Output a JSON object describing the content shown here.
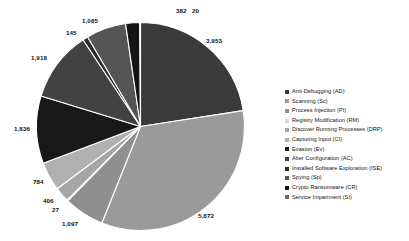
{
  "chart_data": {
    "type": "pie",
    "title": "",
    "xlabel": "",
    "ylabel": "",
    "legend_position": "right",
    "grid": false,
    "total": 17545,
    "categories": [
      "Anti-Debugging (AD)",
      "Scanning (Sc)",
      "Process Injection (PI)",
      "Registry Modification (RM)",
      "Discover Running Processes (DRP)",
      "Capturing Input (CI)",
      "Evasion (Ev)",
      "Alter Configuration (AC)",
      "Installed Software Exploration (ISE)",
      "Spying (Sp)",
      "Crypto Ransomware (CR)",
      "Service Impairment (SI)"
    ],
    "values": [
      3953,
      5872,
      1097,
      27,
      406,
      784,
      1836,
      1918,
      145,
      1085,
      382,
      20
    ],
    "colors": [
      "#3a3a3a",
      "#9a9a9a",
      "#8f8f8f",
      "#ffffff",
      "#a5a5a5",
      "#b0b0b0",
      "#181818",
      "#424242",
      "#2c2c2c",
      "#555555",
      "#141414",
      "#6b6b6b"
    ],
    "slices": [
      {
        "label": "Anti-Debugging (AD)",
        "value": 3953,
        "display": "3,953",
        "color": "#3a3a3a"
      },
      {
        "label": "Scanning (Sc)",
        "value": 5872,
        "display": "5,872",
        "color": "#9a9a9a"
      },
      {
        "label": "Process Injection (PI)",
        "value": 1097,
        "display": "1,097",
        "color": "#8f8f8f"
      },
      {
        "label": "Registry Modification (RM)",
        "value": 27,
        "display": "27",
        "color": "#ffffff"
      },
      {
        "label": "Discover Running Processes (DRP)",
        "value": 406,
        "display": "406",
        "color": "#a5a5a5"
      },
      {
        "label": "Capturing Input (CI)",
        "value": 784,
        "display": "784",
        "color": "#b0b0b0"
      },
      {
        "label": "Evasion (Ev)",
        "value": 1836,
        "display": "1,836",
        "color": "#181818"
      },
      {
        "label": "Alter Configuration (AC)",
        "value": 1918,
        "display": "1,918",
        "color": "#424242"
      },
      {
        "label": "Installed Software Exploration (ISE)",
        "value": 145,
        "display": "145",
        "color": "#2c2c2c"
      },
      {
        "label": "Spying (Sp)",
        "value": 1085,
        "display": "1,085",
        "color": "#555555"
      },
      {
        "label": "Crypto Ransomware (CR)",
        "value": 382,
        "display": "382",
        "color": "#141414"
      },
      {
        "label": "Service Impairment (SI)",
        "value": 20,
        "display": "20",
        "color": "#6b6b6b"
      }
    ]
  },
  "labels": {
    "v_3953": "3,953",
    "v_5872": "5,872",
    "v_1097": "1,097",
    "v_27": "27",
    "v_406": "406",
    "v_784": "784",
    "v_1836": "1,836",
    "v_1918": "1,918",
    "v_145": "145",
    "v_1085": "1,085",
    "v_382": "382",
    "v_20": "20"
  },
  "legend": {
    "items": [
      {
        "label": "Anti-Debugging (AD)",
        "color": "#3a3a3a"
      },
      {
        "label": "Scanning (Sc)",
        "color": "#9a9a9a"
      },
      {
        "label": "Process Injection (PI)",
        "color": "#8f8f8f"
      },
      {
        "label": "Registry Modification (RM)",
        "color": "#d8d8d8"
      },
      {
        "label": "Discover Running Processes (DRP)",
        "color": "#a5a5a5"
      },
      {
        "label": "Capturing Input (CI)",
        "color": "#b0b0b0"
      },
      {
        "label": "Evasion (Ev)",
        "color": "#181818"
      },
      {
        "label": "Alter Configuration (AC)",
        "color": "#424242"
      },
      {
        "label": "Installed Software Exploration (ISE)",
        "color": "#2c2c2c"
      },
      {
        "label": "Spying (Sp)",
        "color": "#555555"
      },
      {
        "label": "Crypto Ransomware (CR)",
        "color": "#141414"
      },
      {
        "label": "Service Impairment (SI)",
        "color": "#6b6b6b"
      }
    ]
  }
}
